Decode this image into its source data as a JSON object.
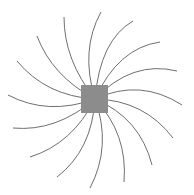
{
  "diagram": {
    "type": "radial-spiral",
    "background": "#ffffff",
    "center": {
      "x": 95,
      "y": 99
    },
    "hub": {
      "x": 81,
      "y": 85,
      "width": 27,
      "height": 28,
      "color": "#8c8c8c"
    },
    "arm_color": "#6f6f6f",
    "arm_width": 1,
    "arms": [
      {
        "end": [
          101,
          12
        ],
        "ctrl": [
          80,
          50
        ]
      },
      {
        "end": [
          133,
          21
        ],
        "ctrl": [
          100,
          40
        ]
      },
      {
        "end": [
          160,
          42
        ],
        "ctrl": [
          118,
          48
        ]
      },
      {
        "end": [
          177,
          71
        ],
        "ctrl": [
          132,
          60
        ]
      },
      {
        "end": [
          182,
          105
        ],
        "ctrl": [
          140,
          78
        ]
      },
      {
        "end": [
          173,
          138
        ],
        "ctrl": [
          144,
          100
        ]
      },
      {
        "end": [
          152,
          165
        ],
        "ctrl": [
          140,
          118
        ]
      },
      {
        "end": [
          124,
          182
        ],
        "ctrl": [
          128,
          134
        ]
      },
      {
        "end": [
          90,
          188
        ],
        "ctrl": [
          112,
          146
        ]
      },
      {
        "end": [
          57,
          177
        ],
        "ctrl": [
          92,
          150
        ]
      },
      {
        "end": [
          30,
          157
        ],
        "ctrl": [
          72,
          144
        ]
      },
      {
        "end": [
          13,
          128
        ],
        "ctrl": [
          56,
          132
        ]
      },
      {
        "end": [
          8,
          95
        ],
        "ctrl": [
          48,
          116
        ]
      },
      {
        "end": [
          17,
          61
        ],
        "ctrl": [
          46,
          96
        ]
      },
      {
        "end": [
          37,
          36
        ],
        "ctrl": [
          52,
          76
        ]
      },
      {
        "end": [
          64,
          17
        ],
        "ctrl": [
          64,
          60
        ]
      }
    ]
  }
}
